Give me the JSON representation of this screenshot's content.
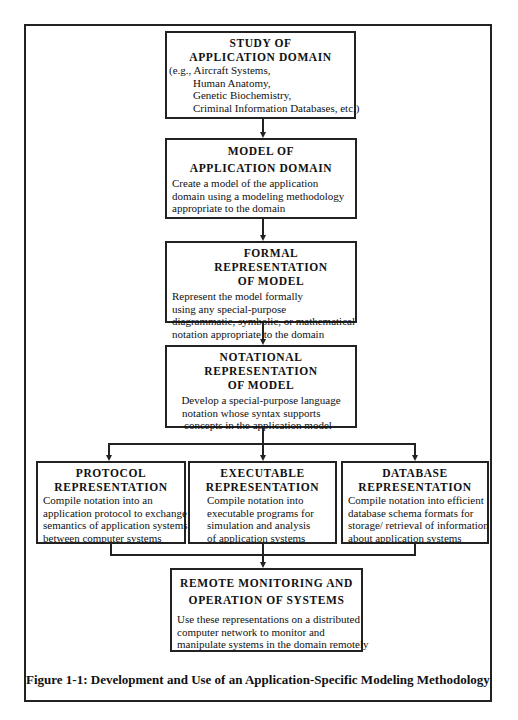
{
  "diagram": {
    "boxes": {
      "study": {
        "title_line1": "STUDY OF",
        "title_line2": "APPLICATION DOMAIN",
        "lines": [
          "(e.g., Aircraft Systems,",
          "Human Anatomy,",
          "Genetic Biochemistry,",
          "Criminal Information Databases, etc.)"
        ]
      },
      "model": {
        "title_line1": "MODEL OF",
        "title_line2": "APPLICATION DOMAIN",
        "lines": [
          "Create a model of the application",
          "domain using a modeling methodology",
          "appropriate to the domain"
        ]
      },
      "formal": {
        "title_line1": "FORMAL REPRESENTATION",
        "title_line2": "OF MODEL",
        "lines": [
          "Represent the model formally",
          "using any special-purpose",
          "diagrammatic, symbolic, or mathematical",
          "notation appropriate to the domain"
        ]
      },
      "notational": {
        "title_line1": "NOTATIONAL",
        "title_line2": "REPRESENTATION",
        "title_line3": "OF MODEL",
        "lines": [
          "Develop a special-purpose language",
          "notation whose syntax supports",
          "concepts in the application model"
        ]
      },
      "protocol": {
        "title_line1": "PROTOCOL",
        "title_line2": "REPRESENTATION",
        "lines": [
          "Compile notation into an",
          "application protocol to exchange",
          "semantics of application systems",
          "between computer systems"
        ]
      },
      "executable": {
        "title_line1": "EXECUTABLE",
        "title_line2": "REPRESENTATION",
        "lines": [
          "Compile notation into",
          "executable programs for",
          "simulation and analysis",
          "of application systems"
        ]
      },
      "database": {
        "title_line1": "DATABASE",
        "title_line2": "REPRESENTATION",
        "lines": [
          "Compile notation into efficient",
          "database schema formats for",
          "storage/ retrieval of information",
          "about application systems"
        ]
      },
      "remote": {
        "title_line1": "REMOTE MONITORING AND",
        "title_line2": "OPERATION OF SYSTEMS",
        "lines": [
          "Use these representations on a distributed",
          "computer network to monitor and",
          "manipulate systems in the domain remotely"
        ]
      }
    },
    "flow": [
      [
        "study",
        "model"
      ],
      [
        "model",
        "formal"
      ],
      [
        "formal",
        "notational"
      ],
      [
        "notational",
        "protocol"
      ],
      [
        "notational",
        "executable"
      ],
      [
        "notational",
        "database"
      ],
      [
        "protocol",
        "remote"
      ],
      [
        "executable",
        "remote"
      ],
      [
        "database",
        "remote"
      ]
    ],
    "caption": "Figure 1-1: Development and Use of an Application-Specific Modeling Methodology"
  }
}
